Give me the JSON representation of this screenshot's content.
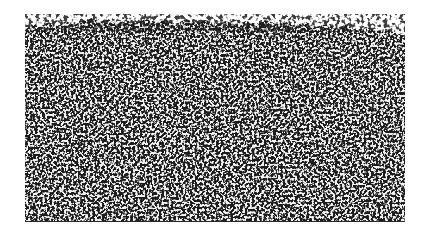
{
  "figure": {
    "region": {
      "x": 25,
      "y": 18,
      "width": 380,
      "height": 204
    },
    "colors": {
      "background": "#ffffff",
      "ink": "#1a1a1a"
    },
    "caption": ""
  }
}
